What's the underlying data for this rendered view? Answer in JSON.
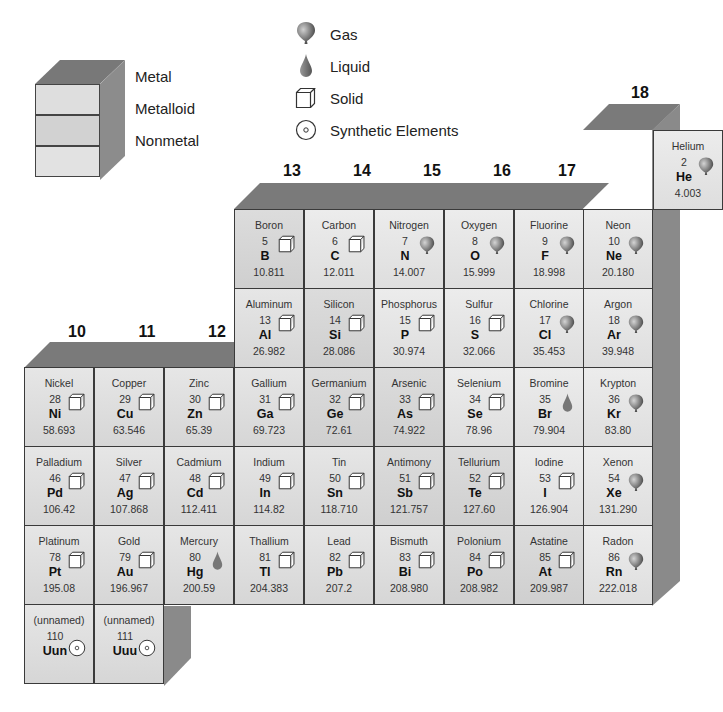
{
  "legend": {
    "categories": [
      {
        "label": "Metal",
        "color": "#dcdcdc"
      },
      {
        "label": "Metalloid",
        "color": "#cfcfcf"
      },
      {
        "label": "Nonmetal",
        "color": "#e4e4e4"
      }
    ],
    "states": [
      {
        "label": "Gas",
        "icon": "balloon-icon"
      },
      {
        "label": "Liquid",
        "icon": "droplet-icon"
      },
      {
        "label": "Solid",
        "icon": "cube-icon"
      },
      {
        "label": "Synthetic Elements",
        "icon": "target-icon"
      }
    ]
  },
  "groups": [
    "10",
    "11",
    "12",
    "13",
    "14",
    "15",
    "16",
    "17",
    "18"
  ],
  "elements": [
    {
      "name": "Helium",
      "number": "2",
      "symbol": "He",
      "mass": "4.003",
      "state": "gas",
      "type": "nonmetal",
      "col": 6,
      "row": 0
    },
    {
      "name": "Boron",
      "number": "5",
      "symbol": "B",
      "mass": "10.811",
      "state": "solid",
      "type": "metalloid",
      "col": 0,
      "row": 1
    },
    {
      "name": "Carbon",
      "number": "6",
      "symbol": "C",
      "mass": "12.011",
      "state": "solid",
      "type": "nonmetal",
      "col": 1,
      "row": 1
    },
    {
      "name": "Nitrogen",
      "number": "7",
      "symbol": "N",
      "mass": "14.007",
      "state": "gas",
      "type": "nonmetal",
      "col": 2,
      "row": 1
    },
    {
      "name": "Oxygen",
      "number": "8",
      "symbol": "O",
      "mass": "15.999",
      "state": "gas",
      "type": "nonmetal",
      "col": 3,
      "row": 1
    },
    {
      "name": "Fluorine",
      "number": "9",
      "symbol": "F",
      "mass": "18.998",
      "state": "gas",
      "type": "nonmetal",
      "col": 4,
      "row": 1
    },
    {
      "name": "Neon",
      "number": "10",
      "symbol": "Ne",
      "mass": "20.180",
      "state": "gas",
      "type": "nonmetal",
      "col": 5,
      "row": 1
    },
    {
      "name": "Aluminum",
      "number": "13",
      "symbol": "Al",
      "mass": "26.982",
      "state": "solid",
      "type": "metal",
      "col": 0,
      "row": 2
    },
    {
      "name": "Silicon",
      "number": "14",
      "symbol": "Si",
      "mass": "28.086",
      "state": "solid",
      "type": "metalloid",
      "col": 1,
      "row": 2
    },
    {
      "name": "Phosphorus",
      "number": "15",
      "symbol": "P",
      "mass": "30.974",
      "state": "solid",
      "type": "nonmetal",
      "col": 2,
      "row": 2
    },
    {
      "name": "Sulfur",
      "number": "16",
      "symbol": "S",
      "mass": "32.066",
      "state": "solid",
      "type": "nonmetal",
      "col": 3,
      "row": 2
    },
    {
      "name": "Chlorine",
      "number": "17",
      "symbol": "Cl",
      "mass": "35.453",
      "state": "gas",
      "type": "nonmetal",
      "col": 4,
      "row": 2
    },
    {
      "name": "Argon",
      "number": "18",
      "symbol": "Ar",
      "mass": "39.948",
      "state": "gas",
      "type": "nonmetal",
      "col": 5,
      "row": 2
    },
    {
      "name": "Nickel",
      "number": "28",
      "symbol": "Ni",
      "mass": "58.693",
      "state": "solid",
      "type": "metal",
      "col": -3,
      "row": 3
    },
    {
      "name": "Copper",
      "number": "29",
      "symbol": "Cu",
      "mass": "63.546",
      "state": "solid",
      "type": "metal",
      "col": -2,
      "row": 3
    },
    {
      "name": "Zinc",
      "number": "30",
      "symbol": "Zn",
      "mass": "65.39",
      "state": "solid",
      "type": "metal",
      "col": -1,
      "row": 3
    },
    {
      "name": "Gallium",
      "number": "31",
      "symbol": "Ga",
      "mass": "69.723",
      "state": "solid",
      "type": "metal",
      "col": 0,
      "row": 3
    },
    {
      "name": "Germanium",
      "number": "32",
      "symbol": "Ge",
      "mass": "72.61",
      "state": "solid",
      "type": "metalloid",
      "col": 1,
      "row": 3
    },
    {
      "name": "Arsenic",
      "number": "33",
      "symbol": "As",
      "mass": "74.922",
      "state": "solid",
      "type": "metalloid",
      "col": 2,
      "row": 3
    },
    {
      "name": "Selenium",
      "number": "34",
      "symbol": "Se",
      "mass": "78.96",
      "state": "solid",
      "type": "nonmetal",
      "col": 3,
      "row": 3
    },
    {
      "name": "Bromine",
      "number": "35",
      "symbol": "Br",
      "mass": "79.904",
      "state": "liquid",
      "type": "nonmetal",
      "col": 4,
      "row": 3
    },
    {
      "name": "Krypton",
      "number": "36",
      "symbol": "Kr",
      "mass": "83.80",
      "state": "gas",
      "type": "nonmetal",
      "col": 5,
      "row": 3
    },
    {
      "name": "Palladium",
      "number": "46",
      "symbol": "Pd",
      "mass": "106.42",
      "state": "solid",
      "type": "metal",
      "col": -3,
      "row": 4
    },
    {
      "name": "Silver",
      "number": "47",
      "symbol": "Ag",
      "mass": "107.868",
      "state": "solid",
      "type": "metal",
      "col": -2,
      "row": 4
    },
    {
      "name": "Cadmium",
      "number": "48",
      "symbol": "Cd",
      "mass": "112.411",
      "state": "solid",
      "type": "metal",
      "col": -1,
      "row": 4
    },
    {
      "name": "Indium",
      "number": "49",
      "symbol": "In",
      "mass": "114.82",
      "state": "solid",
      "type": "metal",
      "col": 0,
      "row": 4
    },
    {
      "name": "Tin",
      "number": "50",
      "symbol": "Sn",
      "mass": "118.710",
      "state": "solid",
      "type": "metal",
      "col": 1,
      "row": 4
    },
    {
      "name": "Antimony",
      "number": "51",
      "symbol": "Sb",
      "mass": "121.757",
      "state": "solid",
      "type": "metalloid",
      "col": 2,
      "row": 4
    },
    {
      "name": "Tellurium",
      "number": "52",
      "symbol": "Te",
      "mass": "127.60",
      "state": "solid",
      "type": "metalloid",
      "col": 3,
      "row": 4
    },
    {
      "name": "Iodine",
      "number": "53",
      "symbol": "I",
      "mass": "126.904",
      "state": "solid",
      "type": "nonmetal",
      "col": 4,
      "row": 4
    },
    {
      "name": "Xenon",
      "number": "54",
      "symbol": "Xe",
      "mass": "131.290",
      "state": "gas",
      "type": "nonmetal",
      "col": 5,
      "row": 4
    },
    {
      "name": "Platinum",
      "number": "78",
      "symbol": "Pt",
      "mass": "195.08",
      "state": "solid",
      "type": "metal",
      "col": -3,
      "row": 5
    },
    {
      "name": "Gold",
      "number": "79",
      "symbol": "Au",
      "mass": "196.967",
      "state": "solid",
      "type": "metal",
      "col": -2,
      "row": 5
    },
    {
      "name": "Mercury",
      "number": "80",
      "symbol": "Hg",
      "mass": "200.59",
      "state": "liquid",
      "type": "metal",
      "col": -1,
      "row": 5
    },
    {
      "name": "Thallium",
      "number": "81",
      "symbol": "Tl",
      "mass": "204.383",
      "state": "solid",
      "type": "metal",
      "col": 0,
      "row": 5
    },
    {
      "name": "Lead",
      "number": "82",
      "symbol": "Pb",
      "mass": "207.2",
      "state": "solid",
      "type": "metal",
      "col": 1,
      "row": 5
    },
    {
      "name": "Bismuth",
      "number": "83",
      "symbol": "Bi",
      "mass": "208.980",
      "state": "solid",
      "type": "metal",
      "col": 2,
      "row": 5
    },
    {
      "name": "Polonium",
      "number": "84",
      "symbol": "Po",
      "mass": "208.982",
      "state": "solid",
      "type": "metalloid",
      "col": 3,
      "row": 5
    },
    {
      "name": "Astatine",
      "number": "85",
      "symbol": "At",
      "mass": "209.987",
      "state": "solid",
      "type": "metalloid",
      "col": 4,
      "row": 5
    },
    {
      "name": "Radon",
      "number": "86",
      "symbol": "Rn",
      "mass": "222.018",
      "state": "gas",
      "type": "nonmetal",
      "col": 5,
      "row": 5
    },
    {
      "name": "(unnamed)",
      "number": "110",
      "symbol": "Uun",
      "mass": "",
      "state": "synthetic",
      "type": "metal",
      "col": -3,
      "row": 6
    },
    {
      "name": "(unnamed)",
      "number": "111",
      "symbol": "Uuu",
      "mass": "",
      "state": "synthetic",
      "type": "metal",
      "col": -2,
      "row": 6
    }
  ]
}
